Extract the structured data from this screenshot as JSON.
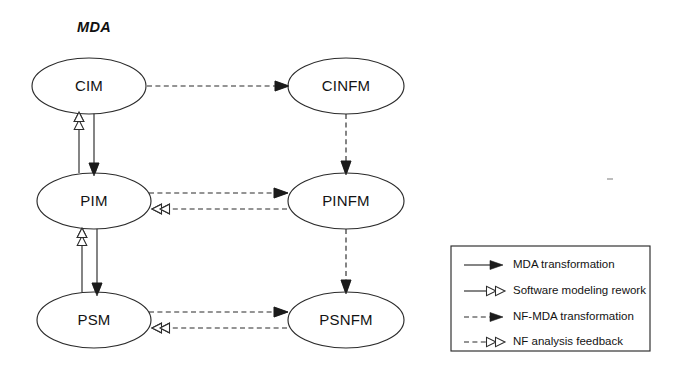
{
  "diagram": {
    "title": "MDA",
    "title_style": "bold-italic",
    "background_color": "#ffffff",
    "stroke_color": "#2b2b2b",
    "text_color": "#131313",
    "nodes": [
      {
        "id": "cim",
        "label": "CIM",
        "cx": 89,
        "cy": 86,
        "rx": 57,
        "ry": 28,
        "column": "left"
      },
      {
        "id": "pim",
        "label": "PIM",
        "cx": 94,
        "cy": 201,
        "rx": 57,
        "ry": 28,
        "column": "left"
      },
      {
        "id": "psm",
        "label": "PSM",
        "cx": 94,
        "cy": 320,
        "rx": 57,
        "ry": 28,
        "column": "left"
      },
      {
        "id": "cinfm",
        "label": "CINFM",
        "cx": 346,
        "cy": 86,
        "rx": 58,
        "ry": 28,
        "column": "right"
      },
      {
        "id": "pinfm",
        "label": "PINFM",
        "cx": 346,
        "cy": 201,
        "rx": 58,
        "ry": 28,
        "column": "right"
      },
      {
        "id": "psnfm",
        "label": "PSNFM",
        "cx": 346,
        "cy": 320,
        "rx": 58,
        "ry": 28,
        "column": "right"
      }
    ],
    "edges": [
      {
        "id": "pim-to-cim",
        "from": "PIM",
        "to": "CIM",
        "kind": "software-modeling-rework",
        "line": "solid",
        "head": "hollow-double",
        "direction": "up"
      },
      {
        "id": "cim-to-pim",
        "from": "CIM",
        "to": "PIM",
        "kind": "mda-transformation",
        "line": "solid",
        "head": "filled",
        "direction": "down"
      },
      {
        "id": "psm-to-pim",
        "from": "PSM",
        "to": "PIM",
        "kind": "software-modeling-rework",
        "line": "solid",
        "head": "hollow-double",
        "direction": "up"
      },
      {
        "id": "pim-to-psm",
        "from": "PIM",
        "to": "PSM",
        "kind": "mda-transformation",
        "line": "solid",
        "head": "filled",
        "direction": "down"
      },
      {
        "id": "cim-to-cinfm",
        "from": "CIM",
        "to": "CINFM",
        "kind": "nf-mda-transformation",
        "line": "dashed",
        "head": "filled",
        "direction": "right"
      },
      {
        "id": "pim-to-pinfm",
        "from": "PIM",
        "to": "PINFM",
        "kind": "nf-mda-transformation",
        "line": "dashed",
        "head": "filled",
        "direction": "right"
      },
      {
        "id": "pinfm-to-pim",
        "from": "PINFM",
        "to": "PIM",
        "kind": "nf-analysis-feedback",
        "line": "dashed",
        "head": "hollow-double",
        "direction": "left"
      },
      {
        "id": "psm-to-psnfm",
        "from": "PSM",
        "to": "PSNFM",
        "kind": "nf-mda-transformation",
        "line": "dashed",
        "head": "filled",
        "direction": "right"
      },
      {
        "id": "psnfm-to-psm",
        "from": "PSNFM",
        "to": "PSM",
        "kind": "nf-analysis-feedback",
        "line": "dashed",
        "head": "hollow-double",
        "direction": "left"
      },
      {
        "id": "cinfm-to-pinfm",
        "from": "CINFM",
        "to": "PINFM",
        "kind": "nf-mda-transformation",
        "line": "dashed",
        "head": "filled",
        "direction": "down"
      },
      {
        "id": "pinfm-to-psnfm",
        "from": "PINFM",
        "to": "PSNFM",
        "kind": "nf-mda-transformation",
        "line": "dashed",
        "head": "filled",
        "direction": "down"
      }
    ]
  },
  "legend": {
    "items": [
      {
        "id": "mda-transformation",
        "label": "MDA transformation",
        "line": "solid",
        "head": "filled"
      },
      {
        "id": "software-modeling-rework",
        "label": "Software modeling rework",
        "line": "solid",
        "head": "hollow-double"
      },
      {
        "id": "nf-mda-transformation",
        "label": "NF-MDA transformation",
        "line": "dashed",
        "head": "filled"
      },
      {
        "id": "nf-analysis-feedback",
        "label": "NF analysis feedback",
        "line": "dashed",
        "head": "hollow-double"
      }
    ],
    "box": {
      "x": 451,
      "y": 246,
      "width": 199,
      "height": 105
    }
  }
}
